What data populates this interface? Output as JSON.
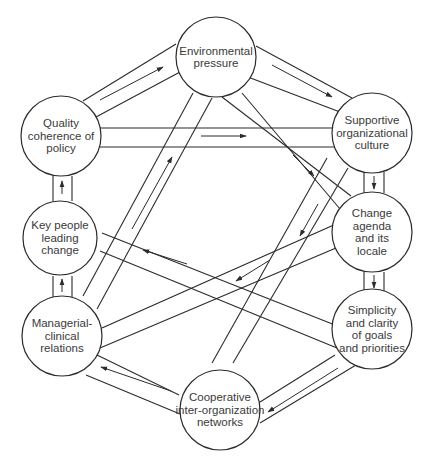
{
  "diagram": {
    "type": "influence-network",
    "colors": {
      "stroke": "#2b2b2b",
      "text": "#3a3a3a",
      "background": "#ffffff"
    },
    "nodes": [
      {
        "id": "env",
        "label": "Environmental\npressure",
        "cx": 216,
        "cy": 57,
        "r": 40
      },
      {
        "id": "qual",
        "label": "Quality\ncoherence of\npolicy",
        "cx": 61,
        "cy": 136,
        "r": 40
      },
      {
        "id": "supp",
        "label": "Supportive\norganizational\nculture",
        "cx": 372,
        "cy": 133,
        "r": 40
      },
      {
        "id": "key",
        "label": "Key people\nleading\nchange",
        "cx": 60,
        "cy": 238,
        "r": 37
      },
      {
        "id": "chg",
        "label": "Change\nagenda\nand its\nlocale",
        "cx": 372,
        "cy": 232,
        "r": 40
      },
      {
        "id": "mgr",
        "label": "Managerial-\nclinical\nrelations",
        "cx": 62,
        "cy": 336,
        "r": 40
      },
      {
        "id": "simp",
        "label": "Simplicity\nand clarity\nof goals\nand priorities",
        "cx": 372,
        "cy": 329,
        "r": 40
      },
      {
        "id": "coop",
        "label": "Cooperative\ninter-organization\nnetworks",
        "cx": 220,
        "cy": 410,
        "r": 40
      }
    ],
    "edges": [
      {
        "from": "env",
        "to": "supp",
        "lines": [
          [
            256,
            46,
            352,
            98
          ],
          [
            240,
            74,
            340,
            112
          ]
        ],
        "arrow": [
          272,
          65,
          332,
          97
        ]
      },
      {
        "from": "qual",
        "to": "env",
        "lines": [
          [
            83,
            101,
            176,
            44
          ],
          [
            96,
            117,
            180,
            72
          ]
        ],
        "arrow": [
          100,
          100,
          163,
          67
        ]
      },
      {
        "from": "qual",
        "to": "supp",
        "lines": [
          [
            100,
            128,
            336,
            128
          ],
          [
            100,
            147,
            336,
            147
          ]
        ],
        "arrow": [
          201,
          136,
          246,
          136
        ]
      },
      {
        "from": "env",
        "to": "chg",
        "lines": [
          [
            222,
            97,
            351,
            196
          ],
          [
            242,
            93,
            340,
            209
          ]
        ],
        "arrow": [
          293,
          155,
          314,
          176
        ]
      },
      {
        "from": "supp",
        "to": "coop",
        "lines": [
          [
            327,
            158,
            212,
            363
          ],
          [
            348,
            168,
            233,
            363
          ]
        ],
        "arrow": [
          318,
          204,
          300,
          236
        ]
      },
      {
        "from": "mgr",
        "to": "env",
        "lines": [
          [
            83,
            296,
            193,
            93
          ],
          [
            97,
            309,
            212,
            98
          ]
        ],
        "arrow": [
          132,
          229,
          172,
          157
        ]
      },
      {
        "from": "simp",
        "to": "key",
        "lines": [
          [
            102,
            233,
            340,
            327
          ],
          [
            100,
            251,
            337,
            348
          ]
        ],
        "arrow": [
          187,
          264,
          143,
          250
        ]
      },
      {
        "from": "chg",
        "to": "mgr",
        "lines": [
          [
            336,
            224,
            102,
            328
          ],
          [
            336,
            248,
            100,
            348
          ]
        ],
        "arrow": [
          270,
          260,
          236,
          281
        ]
      },
      {
        "from": "coop",
        "to": "mgr",
        "lines": [
          [
            179,
            395,
            97,
            355
          ],
          [
            180,
            414,
            86,
            375
          ]
        ],
        "arrow": [
          171,
          391,
          101,
          367
        ]
      },
      {
        "from": "simp",
        "to": "coop",
        "lines": [
          [
            335,
            355,
            260,
            402
          ],
          [
            356,
            365,
            260,
            423
          ]
        ],
        "arrow": [
          338,
          368,
          268,
          412
        ]
      },
      {
        "from": "supp",
        "to": "chg",
        "lines": [
          [
            364,
            172,
            364,
            193
          ],
          [
            384,
            172,
            384,
            193
          ]
        ],
        "arrow": [
          374,
          176,
          374,
          189
        ]
      },
      {
        "from": "chg",
        "to": "simp",
        "lines": [
          [
            364,
            272,
            364,
            291
          ],
          [
            384,
            272,
            384,
            291
          ]
        ],
        "arrow": [
          374,
          275,
          374,
          288
        ]
      },
      {
        "from": "key",
        "to": "qual",
        "lines": [
          [
            53,
            176,
            53,
            201
          ],
          [
            72,
            176,
            72,
            201
          ]
        ],
        "arrow": [
          62,
          194,
          62,
          181
        ]
      },
      {
        "from": "mgr",
        "to": "key",
        "lines": [
          [
            53,
            276,
            53,
            297
          ],
          [
            72,
            276,
            72,
            297
          ]
        ],
        "arrow": [
          62,
          292,
          62,
          279
        ]
      }
    ]
  }
}
